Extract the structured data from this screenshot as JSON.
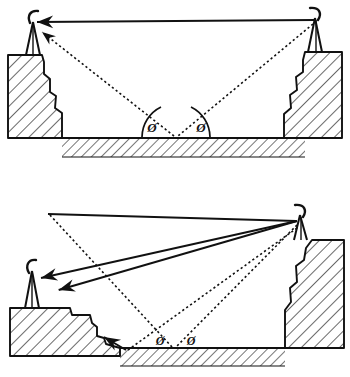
{
  "figure": {
    "title": "",
    "background_color": "#ffffff",
    "ink_color": "#111111",
    "panel_count": 2
  },
  "panels": [
    {
      "id": "top",
      "name": "symmetric-valley-two-ray-panel",
      "description": "Two antennas of equal height on opposing cliffs across a flat valley floor; a direct path and a ground-reflected two-ray path.",
      "antennas": [
        {
          "name": "left-antenna",
          "side": "left",
          "x": 33,
          "y": 22
        },
        {
          "name": "right-antenna",
          "side": "right",
          "x": 315,
          "y": 18
        }
      ],
      "paths": [
        {
          "name": "direct-path",
          "style": "solid",
          "arrow": "left",
          "from": "right-antenna",
          "to": "left-antenna"
        },
        {
          "name": "incident-ray",
          "style": "dotted",
          "arrow": "none",
          "from": "right-antenna",
          "to": "reflection-point"
        },
        {
          "name": "reflected-ray",
          "style": "dotted",
          "arrow": "left",
          "from": "reflection-point",
          "to": "left-antenna"
        }
      ],
      "reflection_point": {
        "name": "ground-reflection-point",
        "x": 176,
        "y": 136
      },
      "angle_labels": [
        {
          "name": "grazing-angle-left",
          "text": "Ø",
          "arc": true,
          "x": 152,
          "y": 128
        },
        {
          "name": "grazing-angle-right",
          "text": "Ø",
          "arc": true,
          "x": 200,
          "y": 128
        }
      ],
      "ground": {
        "name": "valley-floor",
        "hatched": true
      },
      "terrain": [
        {
          "name": "left-cliff",
          "hatched": true
        },
        {
          "name": "right-cliff",
          "hatched": true
        }
      ]
    },
    {
      "id": "bottom",
      "name": "asymmetric-valley-multi-ray-panel",
      "description": "Low antenna on a stepped left terrace and high antenna on a tall right cliff; direct path continues past as an escaping ray, plus ground-reflected and terrain-reflected rays.",
      "antennas": [
        {
          "name": "left-antenna",
          "side": "left",
          "x": 32,
          "y": 281
        },
        {
          "name": "right-antenna",
          "side": "right",
          "x": 300,
          "y": 225
        }
      ],
      "paths": [
        {
          "name": "direct-path",
          "style": "solid",
          "arrow": "left",
          "from": "right-antenna",
          "to": "left-antenna"
        },
        {
          "name": "escaping-ray",
          "style": "solid",
          "arrow": "up-left",
          "from": "right-antenna",
          "to": "open-space"
        },
        {
          "name": "ground-incident-ray",
          "style": "dotted",
          "arrow": "none",
          "from": "right-antenna",
          "to": "ground-reflection-point"
        },
        {
          "name": "ground-reflected-ray",
          "style": "dotted",
          "arrow": "none",
          "from": "ground-reflection-point",
          "to": "upper-left"
        },
        {
          "name": "slope-incident-ray",
          "style": "dotted",
          "arrow": "none",
          "from": "right-antenna",
          "to": "slope-reflection-point"
        },
        {
          "name": "slope-reflected-ray",
          "style": "dotted",
          "arrow": "up-left",
          "from": "slope-reflection-point",
          "to": "left-slope"
        }
      ],
      "angle_labels": [
        {
          "name": "grazing-angle-left",
          "text": "Ø",
          "arc": false,
          "x": 160,
          "y": 350
        },
        {
          "name": "grazing-angle-right",
          "text": "Ø",
          "arc": false,
          "x": 190,
          "y": 350
        }
      ],
      "ground": {
        "name": "valley-floor",
        "hatched": true
      },
      "terrain": [
        {
          "name": "left-terrace",
          "hatched": true
        },
        {
          "name": "right-cliff",
          "hatched": true
        }
      ]
    }
  ],
  "symbols": {
    "phi_label": "Ø",
    "antenna_icon": "antenna-icon",
    "hatch_icon": "hatch-pattern-icon"
  }
}
